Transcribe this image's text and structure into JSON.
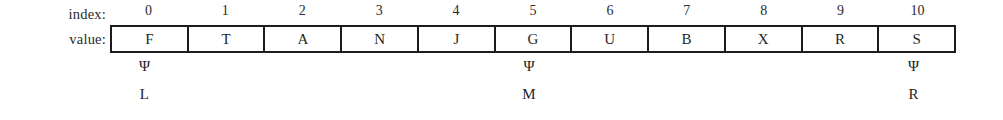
{
  "figure": {
    "type": "array-diagram",
    "row_labels": {
      "index": "index:",
      "value": "value:"
    },
    "indices": [
      "0",
      "1",
      "2",
      "3",
      "4",
      "5",
      "6",
      "7",
      "8",
      "9",
      "10"
    ],
    "values": [
      "F",
      "T",
      "A",
      "N",
      "J",
      "G",
      "U",
      "B",
      "X",
      "R",
      "S"
    ],
    "pointers": [
      {
        "index": 0,
        "symbol": "Ψ",
        "name": "L"
      },
      {
        "index": 5,
        "symbol": "Ψ",
        "name": "M"
      },
      {
        "index": 10,
        "symbol": "Ψ",
        "name": "R"
      }
    ],
    "markers": [
      {
        "symbol": "Ψ",
        "name": "L",
        "visible": true
      },
      {
        "symbol": "",
        "name": "",
        "visible": false
      },
      {
        "symbol": "",
        "name": "",
        "visible": false
      },
      {
        "symbol": "",
        "name": "",
        "visible": false
      },
      {
        "symbol": "",
        "name": "",
        "visible": false
      },
      {
        "symbol": "Ψ",
        "name": "M",
        "visible": true
      },
      {
        "symbol": "",
        "name": "",
        "visible": false
      },
      {
        "symbol": "",
        "name": "",
        "visible": false
      },
      {
        "symbol": "",
        "name": "",
        "visible": false
      },
      {
        "symbol": "",
        "name": "",
        "visible": false
      },
      {
        "symbol": "Ψ",
        "name": "R",
        "visible": true
      }
    ],
    "colors": {
      "background": "#ffffff",
      "border": "#1c1c1c",
      "text": "#1f1f1f"
    }
  }
}
